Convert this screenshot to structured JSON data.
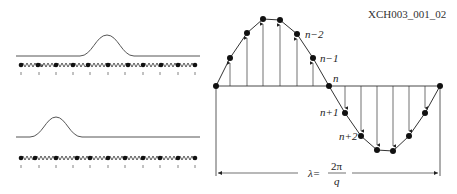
{
  "figure_id": "XCH003_001_02",
  "left_panels": [
    {
      "name": "top",
      "pulse_center_index": 5,
      "atoms": 11
    },
    {
      "name": "bottom",
      "pulse_center_index": 2,
      "atoms": 11
    }
  ],
  "right_panel": {
    "labels": {
      "n_minus_2": "n−2",
      "n_minus_1": "n−1",
      "n": "n",
      "n_plus_1": "n+1",
      "n_plus_2": "n+2"
    },
    "wavelength": {
      "lambda": "λ=",
      "numerator": "2π",
      "denominator": "q"
    }
  }
}
